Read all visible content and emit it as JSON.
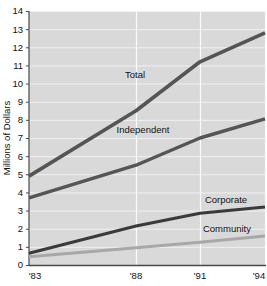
{
  "chart_data": {
    "type": "line",
    "title": "",
    "xlabel": "",
    "ylabel": "Millions of Dollars",
    "x": [
      "'83",
      "'88",
      "'91",
      "'94"
    ],
    "xtick_labels": [
      "'83",
      "'88",
      "'91",
      "'94"
    ],
    "ytick_labels": [
      "0",
      "1",
      "2",
      "3",
      "4",
      "5",
      "6",
      "7",
      "8",
      "9",
      "10",
      "11",
      "12",
      "13",
      "14"
    ],
    "ylim": [
      0,
      14
    ],
    "grid": true,
    "legend_position": "inline-labels",
    "series": [
      {
        "name": "Total",
        "label": "Total",
        "color": "#555555",
        "values": [
          4.9,
          8.5,
          11.2,
          12.8
        ]
      },
      {
        "name": "Independent",
        "label": "Independent",
        "color": "#555555",
        "values": [
          3.7,
          5.5,
          7.0,
          8.05
        ]
      },
      {
        "name": "Corporate",
        "label": "Corporate",
        "color": "#3a3a3a",
        "values": [
          0.65,
          2.15,
          2.85,
          3.2
        ]
      },
      {
        "name": "Community",
        "label": "Community",
        "color": "#a8a8a8",
        "values": [
          0.45,
          0.95,
          1.25,
          1.6
        ]
      }
    ]
  },
  "colors": {
    "plot_background": "#d9d9d9",
    "gridline": "#f0f0f0",
    "axis": "#4a4a4a",
    "page_background": "#ffffff",
    "text": "#111111"
  },
  "labels": {
    "y_axis_title": "Millions of Dollars",
    "series_total": "Total",
    "series_independent": "Independent",
    "series_corporate": "Corporate",
    "series_community": "Community"
  }
}
